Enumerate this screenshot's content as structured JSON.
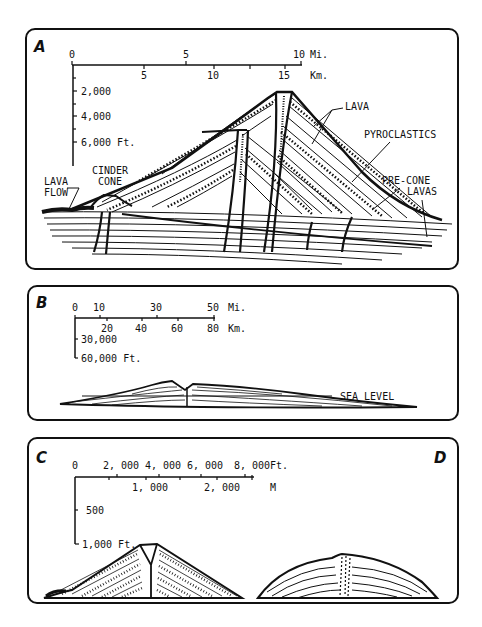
{
  "figure": {
    "panels": [
      {
        "id": "A",
        "letter": "A",
        "scale": {
          "miles_label": "Mi.",
          "miles_ticks": [
            "0",
            "5",
            "10"
          ],
          "km_label": "Km.",
          "km_ticks": [
            "5",
            "10",
            "15"
          ],
          "ft_ticks": [
            "2,000",
            "4,000",
            "6,000 Ft."
          ]
        },
        "labels": {
          "lava": "LAVA",
          "pyroclastics": "PYROCLASTICS",
          "pre_cone_1": "PRE-CONE",
          "pre_cone_2": "LAVAS",
          "cinder_1": "CINDER",
          "cinder_2": "CONE",
          "lava_flow_1": "LAVA",
          "lava_flow_2": "FLOW"
        }
      },
      {
        "id": "B",
        "letter": "B",
        "scale": {
          "miles_label": "Mi.",
          "miles_ticks": [
            "0",
            "10",
            "30",
            "50"
          ],
          "km_label": "Km.",
          "km_ticks": [
            "20",
            "40",
            "60",
            "80"
          ],
          "ft_ticks": [
            "30,000",
            "60,000 Ft."
          ]
        },
        "labels": {
          "sea_level": "SEA LEVEL"
        }
      },
      {
        "id": "C",
        "letter": "C",
        "scale": {
          "ft_label": "Ft.",
          "ft_ticks": [
            "0",
            "2, 000",
            "4, 000",
            "6, 000",
            "8, 000"
          ],
          "m_label": "M",
          "m_ticks": [
            "1, 000",
            "2, 000"
          ],
          "vert_ticks": [
            "500",
            "1,000 Ft."
          ]
        }
      },
      {
        "id": "D",
        "letter": "D"
      }
    ]
  }
}
